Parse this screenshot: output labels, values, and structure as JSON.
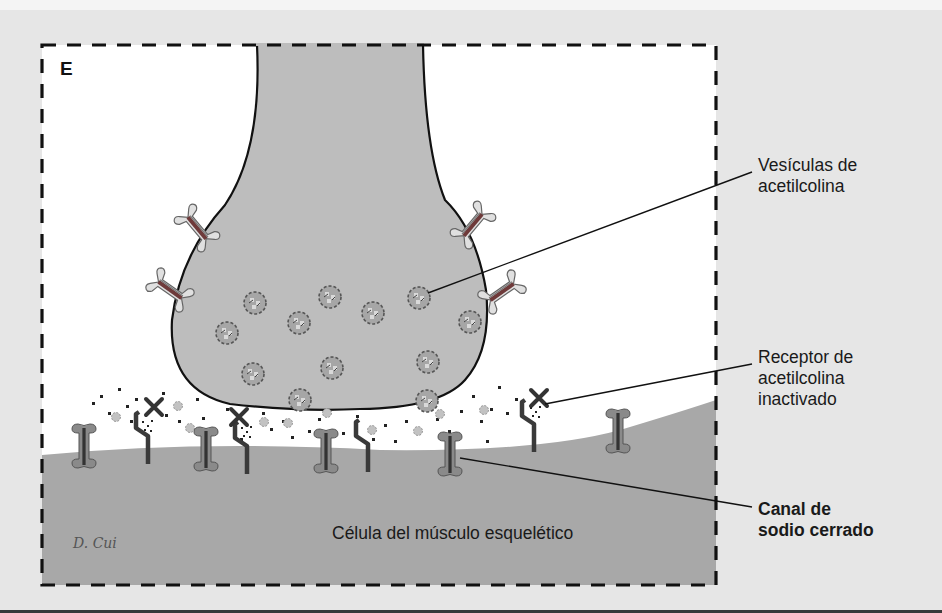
{
  "figure": {
    "panel_letter": "E",
    "signature": "D. Cui",
    "colors": {
      "background": "#e6e6e6",
      "synaptic_cleft": "#ffffff",
      "nerve_terminal": "#bdbdbd",
      "muscle_cell": "#a8a8a8",
      "frame_dash": "#111111",
      "sodium_channel": "#8a8a8a",
      "channel_core": "#333333",
      "presynaptic_channel": "#d8d8d8",
      "vesicle": "#9a9a9a",
      "receptor": "#3a3a3a"
    }
  },
  "labels": {
    "vesicles": [
      "Vesículas de",
      "acetilcolina"
    ],
    "receptor": [
      "Receptor de",
      "acetilcolina",
      "inactivado"
    ],
    "sodium_channel": [
      "Canal de",
      "sodio cerrado"
    ],
    "muscle_cell": "Célula del músculo esquelético"
  }
}
